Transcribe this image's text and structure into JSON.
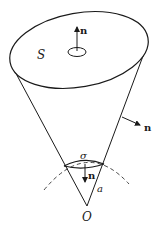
{
  "diagram": {
    "type": "solid-angle-cone",
    "labels": {
      "surface": "S",
      "normal_top": "n",
      "normal_side": "n",
      "sigma": "σ",
      "normal_sigma": "n",
      "radius": "a",
      "origin": "O"
    },
    "colors": {
      "stroke": "#1a1a1a",
      "background": "#ffffff"
    }
  }
}
